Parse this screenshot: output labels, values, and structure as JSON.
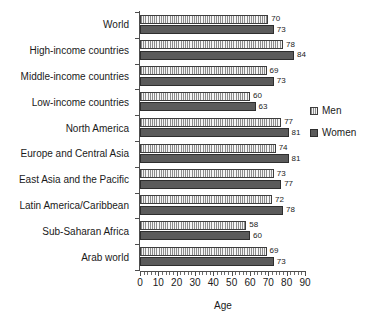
{
  "chart_data": {
    "type": "bar",
    "orientation": "horizontal",
    "title": "",
    "xlabel": "Age",
    "ylabel": "",
    "xlim": [
      0,
      90
    ],
    "xticks": [
      0,
      10,
      20,
      30,
      40,
      50,
      60,
      70,
      80,
      90
    ],
    "grid": false,
    "legend_position": "right",
    "categories": [
      "World",
      "High-income countries",
      "Middle-income countries",
      "Low-income countries",
      "North America",
      "Europe and Central Asia",
      "East Asia and the Pacific",
      "Latin America/Caribbean",
      "Sub-Saharan Africa",
      "Arab world"
    ],
    "series": [
      {
        "name": "Men",
        "color": "#ededed",
        "values": [
          70,
          78,
          69,
          60,
          77,
          74,
          73,
          72,
          58,
          69
        ]
      },
      {
        "name": "Women",
        "color": "#5b5b5b",
        "values": [
          73,
          84,
          73,
          63,
          81,
          81,
          77,
          78,
          60,
          73
        ]
      }
    ]
  },
  "legend": {
    "items": [
      {
        "label": "Men"
      },
      {
        "label": "Women"
      }
    ]
  }
}
